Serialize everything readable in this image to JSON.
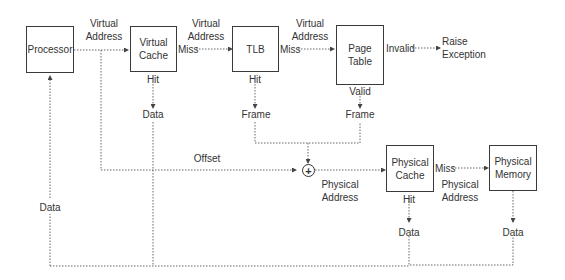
{
  "diagram": {
    "nodes": {
      "processor": "Processor",
      "virtual_cache": [
        "Virtual",
        "Cache"
      ],
      "tlb": "TLB",
      "page_table": [
        "Page",
        "Table"
      ],
      "physical_cache": [
        "Physical",
        "Cache"
      ],
      "physical_memory": [
        "Physical",
        "Memory"
      ],
      "adder": "+"
    },
    "labels": {
      "va1": [
        "Virtual",
        "Address"
      ],
      "va2": [
        "Virtual",
        "Address"
      ],
      "va3": [
        "Virtual",
        "Address"
      ],
      "miss_vc": "Miss",
      "miss_tlb": "Miss",
      "invalid": "Invalid",
      "raise_exception": [
        "Raise",
        "Exception"
      ],
      "hit_vc": "Hit",
      "data_vc": "Data",
      "hit_tlb": "Hit",
      "frame_tlb": "Frame",
      "valid_pt": "Valid",
      "frame_pt": "Frame",
      "offset": "Offset",
      "pa1": [
        "Physical",
        "Address"
      ],
      "miss_pc": "Miss",
      "pa2": [
        "Physical",
        "Address"
      ],
      "hit_pc": "Hit",
      "data_pc": "Data",
      "data_pm": "Data",
      "data_proc": "Data"
    },
    "colors": {
      "line": "#555555",
      "box": "#3a3a3a",
      "text": "#333333"
    }
  }
}
